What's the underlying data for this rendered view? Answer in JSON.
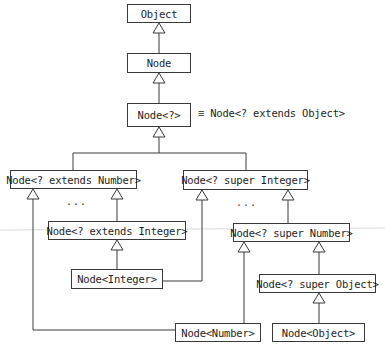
{
  "diagram": {
    "type": "class-hierarchy",
    "nodes": [
      {
        "id": "object",
        "label": "Object"
      },
      {
        "id": "node",
        "label": "Node"
      },
      {
        "id": "node_wild",
        "label": "Node<?>"
      },
      {
        "id": "ext_number",
        "label": "Node<? extends Number>"
      },
      {
        "id": "super_integer",
        "label": "Node<? super Integer>"
      },
      {
        "id": "ext_integer",
        "label": "Node<? extends Integer>"
      },
      {
        "id": "super_number",
        "label": "Node<? super Number>"
      },
      {
        "id": "node_integer",
        "label": "Node<Integer>"
      },
      {
        "id": "super_object",
        "label": "Node<? super Object>"
      },
      {
        "id": "node_number",
        "label": "Node<Number>"
      },
      {
        "id": "node_object",
        "label": "Node<Object>"
      }
    ],
    "equivalence_note": "≡ Node<? extends Object>",
    "ellipsis_left": "...",
    "ellipsis_right": "...",
    "edges": [
      {
        "from": "node",
        "to": "object"
      },
      {
        "from": "node_wild",
        "to": "node"
      },
      {
        "from": "ext_number",
        "to": "node_wild"
      },
      {
        "from": "super_integer",
        "to": "node_wild"
      },
      {
        "from": "ext_integer",
        "to": "ext_number"
      },
      {
        "from": "node_integer",
        "to": "ext_integer"
      },
      {
        "from": "node_integer",
        "to": "super_integer"
      },
      {
        "from": "node_number",
        "to": "ext_number"
      },
      {
        "from": "node_number",
        "to": "super_number"
      },
      {
        "from": "super_number",
        "to": "super_integer"
      },
      {
        "from": "super_object",
        "to": "super_number"
      },
      {
        "from": "node_object",
        "to": "super_object"
      }
    ]
  }
}
